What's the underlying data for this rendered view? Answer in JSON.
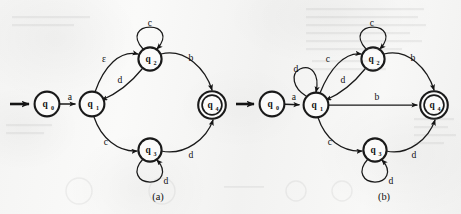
{
  "figure": {
    "kind": "finite-automaton-diagram-pair",
    "background_color": "#f5f5f4",
    "ink_color": "#1a1a1a",
    "width": 461,
    "height": 214
  },
  "diagrams": [
    {
      "id": "a",
      "caption": "(a)",
      "caption_x": 158,
      "caption_y": 196,
      "start_state": "q0",
      "accepting_states": [
        "q4"
      ],
      "states": [
        {
          "id": "q0",
          "label": "q",
          "sub": "0",
          "cx": 47,
          "cy": 104,
          "r": 12.4,
          "accepting": false
        },
        {
          "id": "q1",
          "label": "q",
          "sub": "1",
          "cx": 92,
          "cy": 104,
          "r": 12.4,
          "accepting": false
        },
        {
          "id": "q2",
          "label": "q",
          "sub": "2",
          "cx": 150,
          "cy": 59,
          "r": 11.6,
          "accepting": false
        },
        {
          "id": "q3",
          "label": "q",
          "sub": "3",
          "cx": 150,
          "cy": 150,
          "r": 11.6,
          "accepting": false
        },
        {
          "id": "q4",
          "label": "q",
          "sub": "4",
          "cx": 212,
          "cy": 105,
          "r": 13.8,
          "accepting": true
        }
      ],
      "transitions": [
        {
          "from": "q0",
          "to": "q1",
          "symbol": "a",
          "label_x": 70,
          "label_y": 96
        },
        {
          "from": "q1",
          "to": "q2",
          "symbol": "ε",
          "label_x": 104,
          "label_y": 58
        },
        {
          "from": "q2",
          "to": "q1",
          "symbol": "d",
          "label_x": 120,
          "label_y": 79
        },
        {
          "from": "q2",
          "to": "q2",
          "symbol": "c",
          "label_x": 150,
          "label_y": 22,
          "self_loop": true
        },
        {
          "from": "q2",
          "to": "q4",
          "symbol": "b",
          "label_x": 191,
          "label_y": 57
        },
        {
          "from": "q1",
          "to": "q3",
          "symbol": "c",
          "label_x": 106,
          "label_y": 141
        },
        {
          "from": "q3",
          "to": "q3",
          "symbol": "d",
          "label_x": 166,
          "label_y": 180,
          "self_loop": true
        },
        {
          "from": "q3",
          "to": "q4",
          "symbol": "d",
          "label_x": 191,
          "label_y": 154
        }
      ]
    },
    {
      "id": "b",
      "caption": "(b)",
      "caption_x": 384,
      "caption_y": 196,
      "start_state": "q0",
      "accepting_states": [
        "q4"
      ],
      "states": [
        {
          "id": "q0",
          "label": "q",
          "sub": "0",
          "cx": 272,
          "cy": 104,
          "r": 12.4,
          "accepting": false
        },
        {
          "id": "q1",
          "label": "q",
          "sub": "1",
          "cx": 316,
          "cy": 105,
          "r": 12.4,
          "accepting": false
        },
        {
          "id": "q2",
          "label": "q",
          "sub": "2",
          "cx": 373,
          "cy": 59,
          "r": 11.6,
          "accepting": false
        },
        {
          "id": "q3",
          "label": "q",
          "sub": "3",
          "cx": 375,
          "cy": 150,
          "r": 11.6,
          "accepting": false
        },
        {
          "id": "q4",
          "label": "q",
          "sub": "4",
          "cx": 434,
          "cy": 105,
          "r": 13.8,
          "accepting": true
        }
      ],
      "transitions": [
        {
          "from": "q0",
          "to": "q1",
          "symbol": "a",
          "label_x": 294,
          "label_y": 96
        },
        {
          "from": "q1",
          "to": "q1",
          "symbol": "d",
          "label_x": 296,
          "label_y": 68,
          "self_loop": true
        },
        {
          "from": "q1",
          "to": "q2",
          "symbol": "c",
          "label_x": 328,
          "label_y": 58
        },
        {
          "from": "q2",
          "to": "q1",
          "symbol": "d",
          "label_x": 343,
          "label_y": 79
        },
        {
          "from": "q2",
          "to": "q2",
          "symbol": "c",
          "label_x": 372,
          "label_y": 22,
          "self_loop": true
        },
        {
          "from": "q2",
          "to": "q4",
          "symbol": "b",
          "label_x": 413,
          "label_y": 57
        },
        {
          "from": "q1",
          "to": "q4",
          "symbol": "b",
          "label_x": 377,
          "label_y": 96
        },
        {
          "from": "q1",
          "to": "q3",
          "symbol": "c",
          "label_x": 330,
          "label_y": 141
        },
        {
          "from": "q3",
          "to": "q3",
          "symbol": "d",
          "label_x": 391,
          "label_y": 180,
          "self_loop": true
        },
        {
          "from": "q3",
          "to": "q4",
          "symbol": "d",
          "label_x": 414,
          "label_y": 154
        }
      ]
    }
  ]
}
